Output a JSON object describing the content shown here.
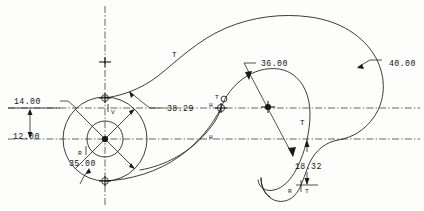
{
  "drawing": {
    "title": "CAD spiral profile geometry",
    "background_color": "#fdfdfc",
    "line_color": "#1a1a1a",
    "dimensions": [
      {
        "id": "d_14",
        "label": "14.00",
        "x": 14,
        "y": 101,
        "kind": "linear-horizontal-offset"
      },
      {
        "id": "d_12",
        "label": "12.00",
        "x": 13,
        "y": 136,
        "kind": "linear-vertical"
      },
      {
        "id": "d_3829",
        "label": "38.29",
        "x": 167,
        "y": 108,
        "kind": "leader-radius"
      },
      {
        "id": "d_r35",
        "label": "R",
        "x": 78,
        "y": 152,
        "kind": "radius-prefix"
      },
      {
        "id": "d_3500",
        "label": "35.00",
        "x": 69,
        "y": 163,
        "kind": "radius-value"
      },
      {
        "id": "d_3600",
        "label": "36.00",
        "x": 261,
        "y": 63,
        "kind": "leader-radius"
      },
      {
        "id": "d_4000",
        "label": "40.00",
        "x": 389,
        "y": 63,
        "kind": "leader-radius"
      },
      {
        "id": "d_1832",
        "label": "18.32",
        "x": 295,
        "y": 166,
        "kind": "linear-vertical"
      },
      {
        "id": "d_rt",
        "label": "R",
        "x": 288,
        "y": 190,
        "kind": "radius-prefix"
      },
      {
        "id": "d_rt2",
        "label": "T",
        "x": 303,
        "y": 190,
        "kind": "tangent-mark"
      }
    ],
    "markers": [
      {
        "id": "m_t_top",
        "label": "T",
        "x": 172,
        "y": 54,
        "kind": "tangent"
      },
      {
        "id": "m_t_mid",
        "label": "T",
        "x": 215,
        "y": 97,
        "kind": "tangent"
      },
      {
        "id": "m_h_mid",
        "label": "H",
        "x": 211,
        "y": 104,
        "kind": "horizontal"
      },
      {
        "id": "m_h_low",
        "label": "H",
        "x": 211,
        "y": 136,
        "kind": "horizontal"
      },
      {
        "id": "m_t_right",
        "label": "T",
        "x": 300,
        "y": 122,
        "kind": "tangent"
      },
      {
        "id": "m_v_hub",
        "label": "V",
        "x": 111,
        "y": 111,
        "kind": "vertical"
      }
    ]
  }
}
